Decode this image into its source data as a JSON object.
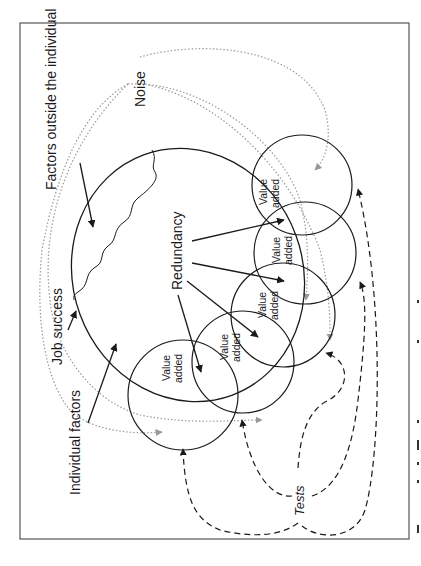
{
  "diagram": {
    "frame": {
      "x": 20,
      "y": 23,
      "width": 389,
      "height": 516
    },
    "labels": {
      "factors_outside": "Factors outside the individual",
      "noise": "Noise",
      "job_success": "Job success",
      "redundancy": "Redundancy",
      "individual_factors": "Individual factors",
      "tests": "Tests"
    },
    "value_added_circles": [
      {
        "line1": "Value",
        "line2": "added"
      },
      {
        "line1": "Value",
        "line2": "added"
      },
      {
        "line1": "Value",
        "line2": "added"
      },
      {
        "line1": "Value",
        "line2": "added"
      },
      {
        "line1": "Value",
        "line2": "added"
      }
    ],
    "colors": {
      "stroke": "#1a1a1a",
      "noise_stroke": "#9a9a9a",
      "frame": "#555555"
    },
    "orientation": "rotated 90deg counter-clockwise"
  }
}
